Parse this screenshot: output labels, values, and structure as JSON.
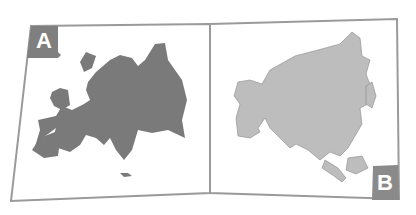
{
  "panels": [
    {
      "label": "A",
      "region": "Europe",
      "fill": "#7a7a7a",
      "label_bg": "#7f7f7f"
    },
    {
      "label": "B",
      "region": "Asia",
      "fill": "#bdbdbd",
      "label_bg": "#8a8a8a"
    }
  ],
  "colors": {
    "frame": "#9a9a9a",
    "background": "#ffffff"
  }
}
